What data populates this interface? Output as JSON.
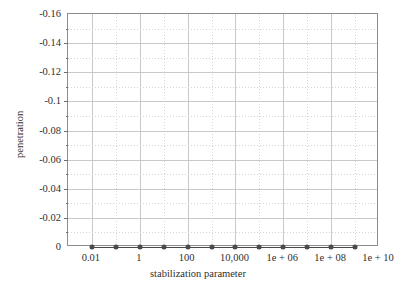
{
  "chart_data": {
    "type": "line",
    "title": "",
    "xlabel": "stabilization parameter",
    "ylabel": "penetration",
    "xscale": "log",
    "xlim": [
      0.001,
      10000000000
    ],
    "ylim": [
      -0.16,
      0
    ],
    "y_axis_inverted": true,
    "grid": true,
    "legend": null,
    "xtick_labels": [
      "0.01",
      "1",
      "100",
      "10,000",
      "1e + 06",
      "1e + 08",
      "1e + 10"
    ],
    "xtick_values": [
      0.01,
      1,
      100,
      10000,
      1000000,
      100000000,
      10000000000
    ],
    "ytick_labels": [
      "-0.16",
      "-0.14",
      "-0.12",
      "-0.1",
      "-0.08",
      "-0.06",
      "-0.04",
      "-0.02",
      "0"
    ],
    "ytick_values": [
      -0.16,
      -0.14,
      -0.12,
      -0.1,
      -0.08,
      -0.06,
      -0.04,
      -0.02,
      0
    ],
    "series": [
      {
        "name": "penetration",
        "marker": "filled-circle",
        "color": "#4a4a4a",
        "x": [
          0.01,
          0.1,
          1,
          10,
          100,
          1000,
          10000,
          100000,
          1000000,
          10000000,
          100000000,
          1000000000
        ],
        "values": [
          0,
          0,
          0,
          0,
          0,
          0,
          0,
          0,
          0,
          0,
          0,
          0
        ]
      }
    ]
  },
  "axis": {
    "x_title": "stabilization parameter",
    "y_title": "penetration"
  }
}
